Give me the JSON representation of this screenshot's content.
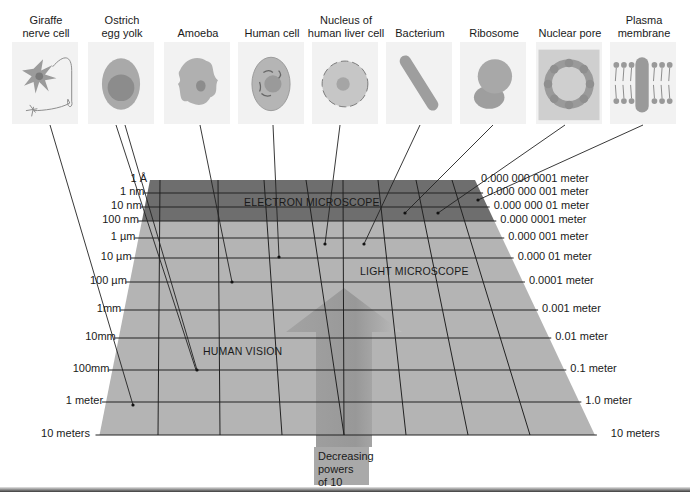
{
  "figure": {
    "specimens": [
      {
        "label": "Giraffe\nnerve cell",
        "icon": "giraffe-nerve-cell-icon",
        "points_to_scale": "1 meter"
      },
      {
        "label": "Ostrich\negg yolk",
        "icon": "ostrich-egg-yolk-icon",
        "points_to_scale": "100mm"
      },
      {
        "label": "Amoeba",
        "icon": "amoeba-icon",
        "points_to_scale": "100 µm"
      },
      {
        "label": "Human cell",
        "icon": "human-cell-icon",
        "points_to_scale": "10 µm"
      },
      {
        "label": "Nucleus of\nhuman liver cell",
        "icon": "liver-nucleus-icon",
        "points_to_scale": "1 µm"
      },
      {
        "label": "Bacterium",
        "icon": "bacterium-icon",
        "points_to_scale": "1 µm"
      },
      {
        "label": "Ribosome",
        "icon": "ribosome-icon",
        "points_to_scale": "10 nm"
      },
      {
        "label": "Nuclear pore",
        "icon": "nuclear-pore-icon",
        "points_to_scale": "10 nm"
      },
      {
        "label": "Plasma\nmembrane",
        "icon": "plasma-membrane-icon",
        "points_to_scale": "1 nm"
      }
    ],
    "left_scale": [
      "1 Å",
      "1 nm",
      "10 nm",
      "100 nm",
      "1 µm",
      "10 µm",
      "100 µm",
      "1mm",
      "10mm",
      "100mm",
      "1 meter",
      "10 meters"
    ],
    "right_scale": [
      "0.000 000 0001 meter",
      "0.000 000 001 meter",
      "0.000 000 01 meter",
      "0.000 0001 meter",
      "0.000 001 meter",
      "0.000 01 meter",
      "0.0001 meter",
      "0.001 meter",
      "0.01 meter",
      "0.1 meter",
      "1.0 meter",
      "10 meters"
    ],
    "regions": {
      "electron": "ELECTRON MICROSCOPE",
      "light": "LIGHT  MICROSCOPE",
      "human": "HUMAN VISION"
    },
    "arrow_caption": "Decreasing\npowers of 10",
    "colors": {
      "electron_band": "#6e6e6e",
      "plane": "#b4b4b4",
      "arrow": "#9c9c9c",
      "grid_line": "#222222"
    }
  }
}
